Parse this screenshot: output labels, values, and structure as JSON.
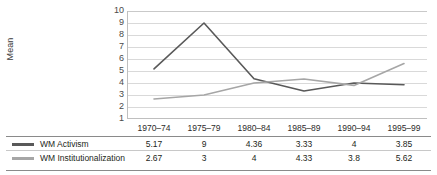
{
  "chart_data": {
    "type": "line",
    "title": "",
    "xlabel": "",
    "ylabel": "Mean",
    "ylim": [
      1,
      10
    ],
    "yticks": [
      10,
      9,
      8,
      7,
      6,
      5,
      4,
      3,
      2,
      1
    ],
    "grid": true,
    "legend_position": "bottom-table",
    "categories": [
      "1970–74",
      "1975–79",
      "1980–84",
      "1985–89",
      "1990–94",
      "1995–99"
    ],
    "series": [
      {
        "name": "WM Activism",
        "color": "#595959",
        "values": [
          5.17,
          9,
          4.36,
          3.33,
          4,
          3.85
        ],
        "labels": [
          "5.17",
          "9",
          "4.36",
          "3.33",
          "4",
          "3.85"
        ]
      },
      {
        "name": "WM Institutionalization",
        "color": "#a6a6a6",
        "values": [
          2.67,
          3,
          4,
          4.33,
          3.8,
          5.62
        ],
        "labels": [
          "2.67",
          "3",
          "4",
          "4.33",
          "3.8",
          "5.62"
        ]
      }
    ]
  },
  "colors": {
    "series_activism": "#595959",
    "series_institutionalization": "#a6a6a6",
    "gridline": "#d9d9d9",
    "axis": "#bfbfbf",
    "rule_strong": "#8a8a8a",
    "rule_light": "#c8c8c8",
    "text": "#231f20"
  }
}
